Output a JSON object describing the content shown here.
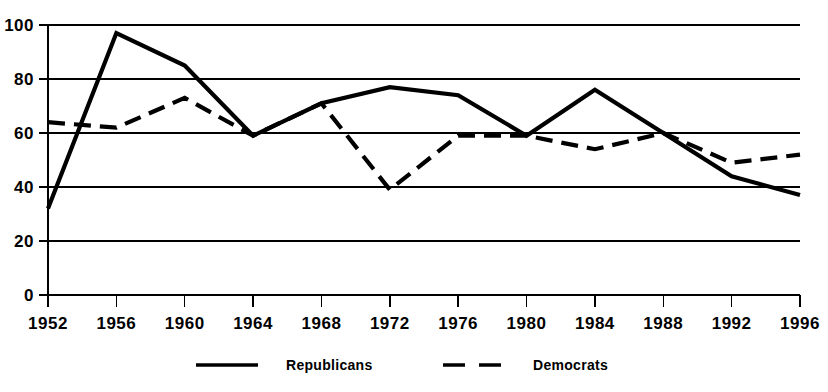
{
  "chart_data": {
    "type": "line",
    "title": "",
    "subtitle": "",
    "xlabel": "",
    "ylabel": "",
    "x": [
      1952,
      1956,
      1960,
      1964,
      1968,
      1972,
      1976,
      1980,
      1984,
      1988,
      1992,
      1996
    ],
    "categories": [
      "1952",
      "1956",
      "1960",
      "1964",
      "1968",
      "1972",
      "1976",
      "1980",
      "1984",
      "1988",
      "1992",
      "1996"
    ],
    "series": [
      {
        "name": "Republicans",
        "style": "solid",
        "color": "#000000",
        "values": [
          32,
          97,
          85,
          59,
          71,
          77,
          74,
          59,
          76,
          60,
          44,
          37
        ]
      },
      {
        "name": "Democrats",
        "style": "dashed",
        "color": "#000000",
        "values": [
          64,
          62,
          73,
          59,
          71,
          39,
          59,
          59,
          54,
          60,
          49,
          52
        ]
      }
    ],
    "ylim": [
      0,
      100
    ],
    "ytick_values": [
      0,
      20,
      40,
      60,
      80,
      100
    ],
    "ytick_labels": [
      "0",
      "20",
      "40",
      "60",
      "80",
      "100"
    ],
    "grid": true,
    "grid_axis": "y",
    "legend_position": "bottom",
    "legend": [
      {
        "label": "Republicans",
        "style": "solid"
      },
      {
        "label": "Democrats",
        "style": "dashed"
      }
    ]
  }
}
